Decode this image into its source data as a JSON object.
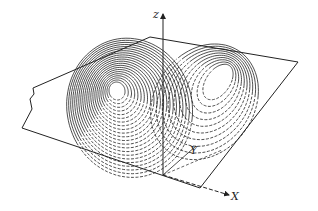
{
  "figure": {
    "axes": {
      "z_label": "z",
      "y_label": "Y",
      "x_label": "X"
    },
    "colors": {
      "ink": "#222222",
      "background": "#ffffff"
    },
    "elements": [
      "z-axis",
      "x-axis",
      "y-axis",
      "projection-plane",
      "left-wing-solid-trajectories",
      "left-wing-dashed-trajectories",
      "right-wing-solid-trajectories",
      "right-wing-dashed-trajectories"
    ]
  }
}
